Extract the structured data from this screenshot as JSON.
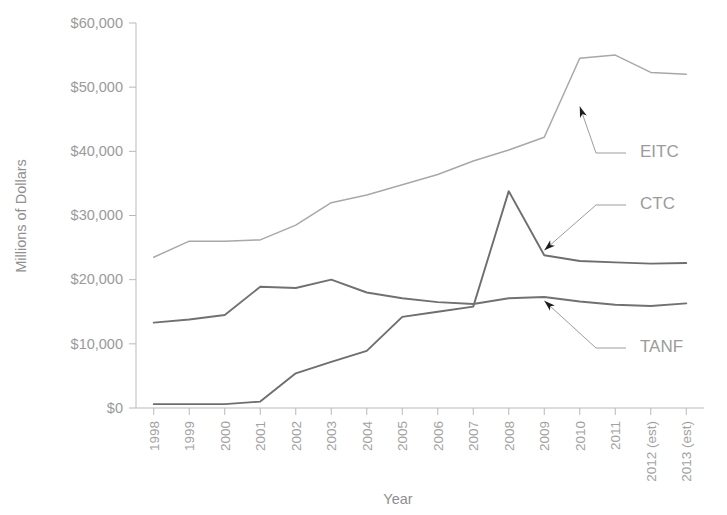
{
  "chart_data": {
    "type": "line",
    "title": "",
    "xlabel": "Year",
    "ylabel": "Millions of Dollars",
    "grid": false,
    "legend_position": "inline-annotations",
    "ylim": [
      0,
      60000
    ],
    "ytick_labels": [
      "$60,000",
      "$50,000",
      "$40,000",
      "$30,000",
      "$20,000",
      "$10,000",
      "$0"
    ],
    "ytick_values": [
      60000,
      50000,
      40000,
      30000,
      20000,
      10000,
      0
    ],
    "categories": [
      "1998",
      "1999",
      "2000",
      "2001",
      "2002",
      "2003",
      "2004",
      "2005",
      "2006",
      "2007",
      "2008",
      "2009",
      "2010",
      "2011",
      "2012 (est)",
      "2013 (est)"
    ],
    "series": [
      {
        "name": "EITC",
        "color": "#a8a8a8",
        "values": [
          23500,
          26000,
          26000,
          26200,
          28500,
          32000,
          33200,
          34800,
          36400,
          38500,
          40200,
          42200,
          54500,
          55000,
          52300,
          52000
        ]
      },
      {
        "name": "CTC",
        "color": "#6e6e6e",
        "values": [
          600,
          600,
          600,
          1000,
          5400,
          7200,
          8900,
          14200,
          15000,
          15800,
          33800,
          23800,
          22900,
          22700,
          22500,
          22600
        ]
      },
      {
        "name": "TANF",
        "color": "#717171",
        "values": [
          13300,
          13800,
          14500,
          18900,
          18700,
          20000,
          18000,
          17100,
          16500,
          16200,
          17100,
          17300,
          16600,
          16100,
          15900,
          16300
        ]
      }
    ],
    "annotations": [
      {
        "label": "EITC",
        "target_category": "2010",
        "target_value": 47000
      },
      {
        "label": "CTC",
        "target_category": "2009",
        "target_value": 24600
      },
      {
        "label": "TANF",
        "target_category": "2009",
        "target_value": 16700
      }
    ]
  },
  "axis": {
    "y_title": "Millions of Dollars",
    "x_title": "Year"
  }
}
